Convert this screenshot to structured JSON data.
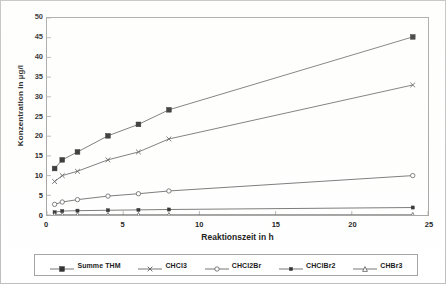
{
  "chart_data": {
    "type": "line",
    "title": "",
    "xlabel": "Reaktionszeit in h",
    "ylabel": "Konzentration in µg/l",
    "xlim": [
      0,
      25
    ],
    "ylim": [
      0,
      50
    ],
    "xticks": [
      0,
      5,
      10,
      15,
      20,
      25
    ],
    "xtick_labels": [
      "0",
      "5",
      "10",
      "15",
      "20",
      "25"
    ],
    "yticks": [
      0,
      5,
      10,
      15,
      20,
      25,
      30,
      35,
      40,
      45,
      50
    ],
    "ytick_labels": [
      "0",
      "5",
      "10",
      "15",
      "20",
      "25",
      "30",
      "35",
      "40",
      "45",
      "50"
    ],
    "grid": false,
    "legend_position": "bottom",
    "x": [
      0.5,
      1,
      2,
      4,
      6,
      8,
      24
    ],
    "series": [
      {
        "name": "Summe THM",
        "marker": "filled-square",
        "values": [
          11.8,
          14.0,
          16.0,
          20.1,
          23.0,
          26.7,
          45.2
        ]
      },
      {
        "name": "CHCl3",
        "marker": "x-cross",
        "values": [
          8.5,
          10.0,
          11.1,
          14.0,
          16.0,
          19.3,
          33.0
        ]
      },
      {
        "name": "CHCl2Br",
        "marker": "open-circle",
        "values": [
          2.7,
          3.3,
          3.9,
          4.8,
          5.4,
          6.1,
          10.0
        ]
      },
      {
        "name": "CHClBr2",
        "marker": "small-filled-square",
        "values": [
          0.7,
          1.0,
          1.1,
          1.2,
          1.3,
          1.4,
          1.9
        ]
      },
      {
        "name": "CHBr3",
        "marker": "open-triangle",
        "values": [
          0.05,
          0.05,
          0.05,
          0.05,
          0.05,
          0.05,
          0.05
        ]
      }
    ]
  },
  "legend": {
    "items": [
      {
        "label": "Summe THM",
        "marker": "filled-square"
      },
      {
        "label": "CHCl3",
        "marker": "x-cross"
      },
      {
        "label": "CHCl2Br",
        "marker": "open-circle"
      },
      {
        "label": "CHClBr2",
        "marker": "small-filled-square"
      },
      {
        "label": "CHBr3",
        "marker": "open-triangle"
      }
    ]
  },
  "colors": {
    "line": "#555555",
    "axis": "#9a9a9a",
    "frame": "#b8b8b8",
    "text": "#000000",
    "background": "#ffffff"
  }
}
